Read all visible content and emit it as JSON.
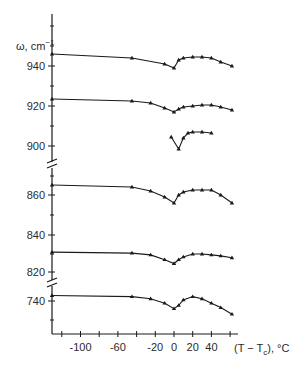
{
  "chart_data": {
    "type": "line",
    "title": "",
    "ylabel": "ω, cm⁻¹",
    "xlabel": "(T − Tc), °C",
    "x_ticks": [
      -100,
      -60,
      -20,
      0,
      20,
      40
    ],
    "y_tick_labels": [
      "940",
      "920",
      "900",
      "860",
      "840",
      "820",
      "740"
    ],
    "y_axis_breaks": [
      "between 900 and 860",
      "between 820 and 740"
    ],
    "grid": false,
    "legend": null,
    "series": [
      {
        "name": "mode ~945",
        "x": [
          -130,
          -45,
          -10,
          0,
          5,
          10,
          20,
          30,
          40,
          50,
          62
        ],
        "y": [
          946,
          944,
          941,
          939,
          943,
          944,
          944.5,
          944.5,
          944,
          942,
          940
        ]
      },
      {
        "name": "mode ~923",
        "x": [
          -130,
          -45,
          -25,
          -10,
          0,
          5,
          10,
          20,
          30,
          40,
          50,
          62
        ],
        "y": [
          923.5,
          922.5,
          921.5,
          919,
          917,
          918.5,
          919.5,
          920,
          920.5,
          920.5,
          919.5,
          918
        ]
      },
      {
        "name": "mode ~905",
        "x": [
          -3,
          5,
          10,
          15,
          20,
          30,
          40
        ],
        "y": [
          904.5,
          898.5,
          904,
          906.5,
          907,
          907,
          906.5
        ]
      },
      {
        "name": "mode ~865",
        "x": [
          -130,
          -45,
          -25,
          -10,
          0,
          5,
          10,
          20,
          30,
          40,
          50,
          62
        ],
        "y": [
          865,
          864,
          862,
          859,
          856,
          860,
          861.5,
          862.5,
          862.5,
          862.5,
          860,
          856
        ]
      },
      {
        "name": "mode ~830",
        "x": [
          -130,
          -45,
          -25,
          -10,
          0,
          5,
          10,
          20,
          30,
          40,
          50,
          62
        ],
        "y": [
          831,
          830.5,
          829.5,
          827,
          825,
          827,
          828.5,
          830,
          830,
          829.5,
          829,
          828
        ]
      },
      {
        "name": "mode ~742",
        "x": [
          -130,
          -45,
          -25,
          -10,
          0,
          5,
          10,
          20,
          30,
          40,
          50,
          62
        ],
        "y": [
          742.5,
          742,
          741,
          739,
          736.5,
          738,
          740.5,
          742,
          741,
          739,
          737,
          734
        ]
      }
    ],
    "xlim": [
      -130,
      75
    ],
    "ylim_segments": [
      [
        893,
        960
      ],
      [
        850,
        870
      ],
      [
        818,
        845
      ],
      [
        728,
        746
      ]
    ]
  },
  "labels": {
    "y_axis_title": "ω, cm",
    "y_axis_exp": "−1",
    "x_axis_title": "(T − T",
    "x_axis_sub": "c",
    "x_axis_tail": "), °C",
    "x_tick_labels": [
      "-100",
      "-60",
      "-20",
      "0",
      "20",
      "40"
    ],
    "y_tick_labels": [
      "940",
      "920",
      "900",
      "860",
      "840",
      "820",
      "740"
    ]
  }
}
